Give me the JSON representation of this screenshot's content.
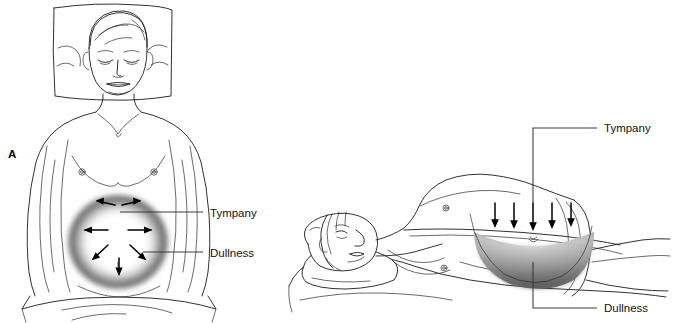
{
  "figure": {
    "background_color": "#ffffff",
    "width": 674,
    "height": 323,
    "ink_color": "#1a1a1a",
    "shading_color": "#4a4a4a",
    "panel_letter": "A"
  },
  "panels": [
    {
      "id": "supine",
      "letter": "A",
      "view": "supine-anterior",
      "description": "Patient lying supine, viewed from the front",
      "callouts": [
        {
          "id": "tympany",
          "label": "Tympany",
          "target": "central-abdomen"
        },
        {
          "id": "dullness",
          "label": "Dullness",
          "target": "flank-periphery"
        }
      ],
      "percussion_arrows": {
        "count": 7,
        "pattern": "radiating-outward-from-center",
        "directions": [
          "up-left",
          "up-right",
          "left",
          "right",
          "down-left",
          "down-right",
          "down"
        ]
      },
      "shading": {
        "type": "radial-ring",
        "meaning": "dullness in dependent flanks",
        "center_tone": "#ffffff",
        "edge_tone": "#3f3f3f"
      }
    },
    {
      "id": "lateral",
      "view": "lateral-decubitus",
      "description": "Patient lying on one side, viewed from the side",
      "callouts": [
        {
          "id": "tympany",
          "label": "Tympany",
          "target": "upper-abdomen"
        },
        {
          "id": "dullness",
          "label": "Dullness",
          "target": "dependent-crescent"
        }
      ],
      "percussion_arrows": {
        "count": 5,
        "pattern": "parallel-downward",
        "directions": [
          "down",
          "down",
          "down",
          "down",
          "down"
        ]
      },
      "shading": {
        "type": "crescent",
        "meaning": "dependent fluid dullness",
        "top_tone": "#e8e8e8",
        "bottom_tone": "#3a3a3a"
      }
    }
  ],
  "labels": {
    "panel_a": "A",
    "left_tympany": "Tympany",
    "left_dullness": "Dullness",
    "right_tympany": "Tympany",
    "right_dullness": "Dullness"
  }
}
